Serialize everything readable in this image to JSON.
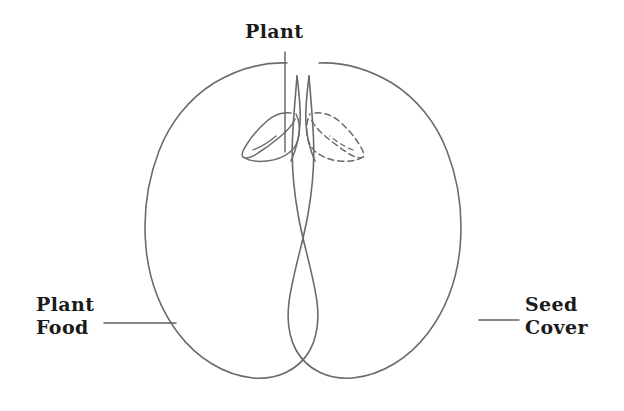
{
  "figure": {
    "type": "line-drawing",
    "stroke_color": "#6b6b6b",
    "text_color": "#1b1b1b",
    "background_color": "#ffffff",
    "leader_line_color": "#5f5f5f"
  },
  "labels": {
    "plant": {
      "text": "Plant",
      "leader": "vertical line from text down to embryo on left cotyledon"
    },
    "plant_food": {
      "line1": "Plant",
      "line2": "Food",
      "leader": "horizontal line pointing right into the left cotyledon"
    },
    "seed_cover": {
      "line1": "Seed",
      "line2": "Cover",
      "leader": "horizontal line pointing left to the right cotyledon outline"
    }
  },
  "parts": [
    {
      "name": "left-cotyledon",
      "style": "solid-outline"
    },
    {
      "name": "right-cotyledon",
      "style": "solid-outline"
    },
    {
      "name": "embryo-solid",
      "style": "solid-outline"
    },
    {
      "name": "embryo-dashed",
      "style": "dashed-outline"
    }
  ]
}
